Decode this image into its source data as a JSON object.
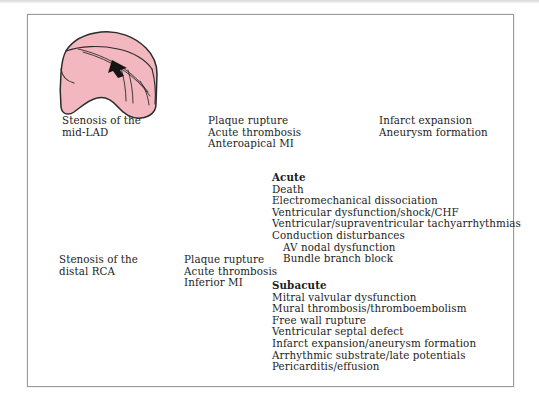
{
  "figure": {
    "title_present": false,
    "colors": {
      "myocardium_pink": "#f3b8bf",
      "infarct_mauve": "#c79ba5",
      "outline": "#2b2b2b",
      "thrombus_black": "#151515",
      "frame_border": "#9a9a9a",
      "arrow": "#555555",
      "text": "#1d1d1d",
      "background": "#ffffff"
    }
  },
  "top_row": {
    "panels": [
      {
        "id": "panel-stenosis-lad",
        "icon": "heart-ventricle-icon",
        "caption_lines": [
          "Stenosis of the",
          "mid-LAD"
        ],
        "caption": "Stenosis of the\nmid-LAD"
      },
      {
        "id": "panel-plaque-rupture-anterior",
        "icon": "heart-ventricle-infarct-icon",
        "caption_lines": [
          "Plaque rupture",
          "Acute thrombosis",
          "Anteroapical MI"
        ],
        "caption": "Plaque rupture\nAcute thrombosis\nAnteroapical MI"
      },
      {
        "id": "panel-infarct-expansion",
        "icon": "heart-ventricle-aneurysm-icon",
        "caption_lines": [
          "Infarct expansion",
          "Aneurysm formation"
        ],
        "caption": "Infarct expansion\nAneurysm formation"
      }
    ],
    "arrows": [
      "arrow-right-icon",
      "arrow-right-icon"
    ]
  },
  "bottom_row": {
    "panels": [
      {
        "id": "panel-stenosis-rca",
        "icon": "heart-inferior-icon",
        "caption_lines": [
          "Stenosis of the",
          "distal RCA"
        ],
        "caption": "Stenosis of the\ndistal RCA"
      },
      {
        "id": "panel-plaque-rupture-inferior",
        "icon": "heart-inferior-infarct-icon",
        "caption_lines": [
          "Plaque rupture",
          "Acute thrombosis",
          "Inferior MI"
        ],
        "caption": "Plaque rupture\nAcute thrombosis\nInferior MI"
      }
    ],
    "arrows": [
      "arrow-right-icon"
    ]
  },
  "complications": {
    "acute": {
      "heading": "Acute",
      "items": [
        {
          "text": "Death",
          "indent": false
        },
        {
          "text": "Electromechanical dissociation",
          "indent": false
        },
        {
          "text": "Ventricular dysfunction/shock/CHF",
          "indent": false
        },
        {
          "text": "Ventricular/supraventricular tachyarrhythmias",
          "indent": false
        },
        {
          "text": "Conduction disturbances",
          "indent": false
        },
        {
          "text": "AV nodal dysfunction",
          "indent": true
        },
        {
          "text": "Bundle branch block",
          "indent": true
        }
      ]
    },
    "subacute": {
      "heading": "Subacute",
      "items": [
        {
          "text": "Mitral valvular dysfunction",
          "indent": false
        },
        {
          "text": "Mural thrombosis/thromboembolism",
          "indent": false
        },
        {
          "text": "Free wall rupture",
          "indent": false
        },
        {
          "text": "Ventricular septal defect",
          "indent": false
        },
        {
          "text": "Infarct expansion/aneurysm formation",
          "indent": false
        },
        {
          "text": "Arrhythmic substrate/late potentials",
          "indent": false
        },
        {
          "text": "Pericarditis/effusion",
          "indent": false
        }
      ]
    }
  }
}
